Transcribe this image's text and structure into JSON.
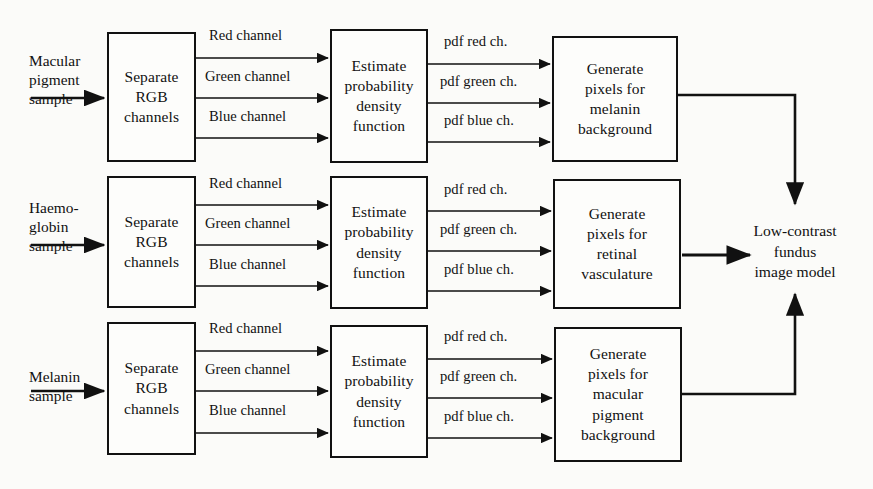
{
  "figure": {
    "background_color": "#fbfbf9",
    "line_color": "#111111"
  },
  "sources": [
    {
      "label": "Macular\npigment\nsample"
    },
    {
      "label": "Haemo-\nglobin\nsample"
    },
    {
      "label": "Melanin\nsample"
    }
  ],
  "stage_labels": {
    "separate": "Separate\nRGB\nchannels",
    "estimate": "Estimate\nprobability\ndensity\nfunction"
  },
  "rows": [
    {
      "source": "Macular pigment sample",
      "separate": "Separate\nRGB\nchannels",
      "channel_labels": [
        "Red channel",
        "Green channel",
        "Blue channel"
      ],
      "estimate": "Estimate\nprobability\ndensity\nfunction",
      "pdf_labels": [
        "pdf red ch.",
        "pdf green ch.",
        "pdf blue ch."
      ],
      "generate": "Generate\npixels for\nmelanin\nbackground"
    },
    {
      "source": "Haemo-globin sample",
      "separate": "Separate\nRGB\nchannels",
      "channel_labels": [
        "Red channel",
        "Green channel",
        "Blue channel"
      ],
      "estimate": "Estimate\nprobability\ndensity\nfunction",
      "pdf_labels": [
        "pdf red ch.",
        "pdf green ch.",
        "pdf blue ch."
      ],
      "generate": "Generate\npixels for\nretinal\nvasculature"
    },
    {
      "source": "Melanin sample",
      "separate": "Separate\nRGB\nchannels",
      "channel_labels": [
        "Red channel",
        "Green channel",
        "Blue channel"
      ],
      "estimate": "Estimate\nprobability\ndensity\nfunction",
      "pdf_labels": [
        "pdf red ch.",
        "pdf green ch.",
        "pdf blue ch."
      ],
      "generate": "Generate\npixels for\nmacular\npigment\nbackground"
    }
  ],
  "output": {
    "label": "Low-contrast\nfundus\nimage model"
  }
}
